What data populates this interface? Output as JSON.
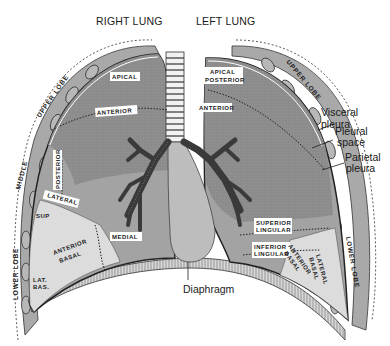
{
  "titles": {
    "right_lung": "RIGHT LUNG",
    "left_lung": "LEFT LUNG"
  },
  "callouts": {
    "visceral_pleura_1": "Visceral",
    "visceral_pleura_2": "pleura",
    "pleural_space_1": "Pleural",
    "pleural_space_2": "space",
    "parietal_pleura_1": "Parietal",
    "parietal_pleura_2": "pleura",
    "diaphragm": "Diaphragm"
  },
  "right_lung_segments": {
    "apical": "APICAL",
    "anterior": "ANTERIOR",
    "posterior": "POSTERIOR",
    "lateral": "LATERAL",
    "sup": "SUP",
    "medial": "MEDIAL",
    "anterior_basal_1": "ANTERIOR",
    "anterior_basal_2": "BASAL",
    "lat_bas_1": "LAT.",
    "lat_bas_2": "BAS."
  },
  "left_lung_segments": {
    "apical_posterior_1": "APICAL",
    "apical_posterior_2": "POSTERIOR",
    "anterior": "ANTERIOR",
    "superior_lingular_1": "SUPERIOR",
    "superior_lingular_2": "LINGULAR",
    "inferior_lingular_1": "INFERIOR",
    "inferior_lingular_2": "LINGULAR",
    "anterior_basal_1": "ANTERIOR",
    "anterior_basal_2": "BASAL",
    "lateral_basal_1": "LATERAL",
    "lateral_basal_2": "BASAL"
  },
  "lobe_labels": {
    "right_upper": "UPPER LOBE",
    "right_middle": "MIDDLE",
    "right_lower": "LOWER LOBE",
    "left_upper": "UPPER LOBE",
    "left_lower": "LOWER LOBE"
  },
  "colors": {
    "lung_dark": "#8a8a8a",
    "lung_mid": "#a6a6a6",
    "lung_light": "#c8c8c8",
    "lung_pale": "#e2e2e2",
    "pleura": "#9a9a9a",
    "outline": "#2a2a2a"
  }
}
